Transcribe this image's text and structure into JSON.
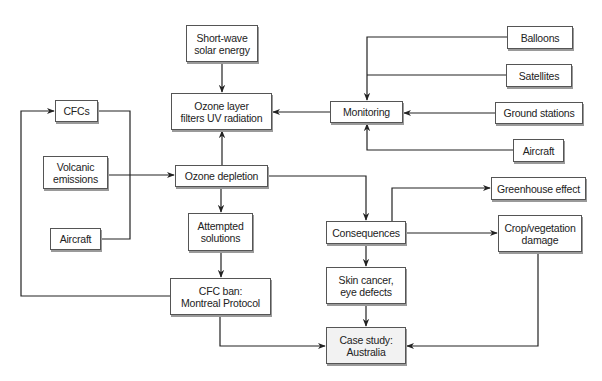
{
  "diagram": {
    "nodes": [
      {
        "id": "shortwave",
        "label": "Short-wave\nsolar energy",
        "x": 186,
        "y": 25,
        "w": 72,
        "h": 37
      },
      {
        "id": "ozone_layer",
        "label": "Ozone layer\nfilters UV radiation",
        "x": 171,
        "y": 93,
        "w": 101,
        "h": 37
      },
      {
        "id": "cfcs",
        "label": "CFCs",
        "x": 55,
        "y": 100,
        "w": 43,
        "h": 22
      },
      {
        "id": "volcanic",
        "label": "Volcanic\nemissions",
        "x": 43,
        "y": 156,
        "w": 65,
        "h": 33
      },
      {
        "id": "ozone_depletion",
        "label": "Ozone depletion",
        "x": 175,
        "y": 165,
        "w": 93,
        "h": 22
      },
      {
        "id": "attempted",
        "label": "Attempted\nsolutions",
        "x": 188,
        "y": 213,
        "w": 65,
        "h": 38
      },
      {
        "id": "aircraft_left",
        "label": "Aircraft",
        "x": 50,
        "y": 228,
        "w": 51,
        "h": 22
      },
      {
        "id": "cfc_ban",
        "label": "CFC ban:\nMontreal Protocol",
        "x": 170,
        "y": 278,
        "w": 101,
        "h": 37
      },
      {
        "id": "monitoring",
        "label": "Monitoring",
        "x": 330,
        "y": 101,
        "w": 73,
        "h": 22
      },
      {
        "id": "balloons",
        "label": "Balloons",
        "x": 507,
        "y": 26,
        "w": 66,
        "h": 23
      },
      {
        "id": "satellites",
        "label": "Satellites",
        "x": 506,
        "y": 64,
        "w": 66,
        "h": 23
      },
      {
        "id": "ground",
        "label": "Ground stations",
        "x": 495,
        "y": 102,
        "w": 88,
        "h": 22
      },
      {
        "id": "aircraft_right",
        "label": "Aircraft",
        "x": 513,
        "y": 139,
        "w": 51,
        "h": 23
      },
      {
        "id": "greenhouse",
        "label": "Greenhouse effect",
        "x": 491,
        "y": 177,
        "w": 95,
        "h": 23
      },
      {
        "id": "consequences",
        "label": "Consequences",
        "x": 326,
        "y": 221,
        "w": 80,
        "h": 23
      },
      {
        "id": "crop",
        "label": "Crop/vegetation\ndamage",
        "x": 498,
        "y": 215,
        "w": 84,
        "h": 37
      },
      {
        "id": "skin",
        "label": "Skin cancer,\neye defects",
        "x": 326,
        "y": 267,
        "w": 80,
        "h": 37
      },
      {
        "id": "case",
        "label": "Case study:\nAustralia",
        "x": 326,
        "y": 327,
        "w": 80,
        "h": 37
      }
    ],
    "edges": [
      {
        "from": "Short-wave solar energy",
        "to": "Ozone layer filters UV radiation"
      },
      {
        "from": "Ozone depletion",
        "to": "Ozone layer filters UV radiation"
      },
      {
        "from": "Monitoring",
        "to": "Ozone layer filters UV radiation"
      },
      {
        "from": "Balloons",
        "to": "Monitoring"
      },
      {
        "from": "Satellites",
        "to": "Monitoring"
      },
      {
        "from": "Ground stations",
        "to": "Monitoring"
      },
      {
        "from": "Aircraft",
        "to": "Monitoring"
      },
      {
        "from": "CFCs",
        "to": "Ozone depletion"
      },
      {
        "from": "Volcanic emissions",
        "to": "Ozone depletion"
      },
      {
        "from": "Aircraft",
        "to": "Ozone depletion"
      },
      {
        "from": "Ozone depletion",
        "to": "Attempted solutions"
      },
      {
        "from": "Attempted solutions",
        "to": "CFC ban: Montreal Protocol"
      },
      {
        "from": "CFC ban: Montreal Protocol",
        "to": "CFCs"
      },
      {
        "from": "CFC ban: Montreal Protocol",
        "to": "Case study: Australia"
      },
      {
        "from": "Ozone depletion",
        "to": "Consequences"
      },
      {
        "from": "Consequences",
        "to": "Greenhouse effect"
      },
      {
        "from": "Consequences",
        "to": "Crop/vegetation damage"
      },
      {
        "from": "Consequences",
        "to": "Skin cancer, eye defects"
      },
      {
        "from": "Skin cancer, eye defects",
        "to": "Case study: Australia"
      },
      {
        "from": "Crop/vegetation damage",
        "to": "Case study: Australia"
      }
    ]
  }
}
